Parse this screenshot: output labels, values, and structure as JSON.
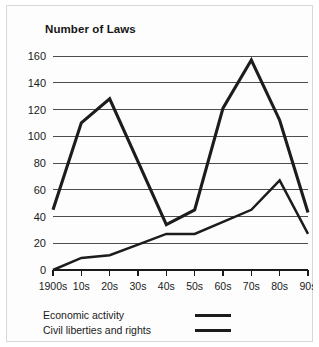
{
  "chart_data": {
    "type": "line",
    "title": "Number of Laws",
    "xlabel": "",
    "ylabel": "",
    "categories": [
      "1900s",
      "10s",
      "20s",
      "30s",
      "40s",
      "50s",
      "60s",
      "70s",
      "80s",
      "90s"
    ],
    "series": [
      {
        "name": "Economic activity",
        "values": [
          45,
          110,
          128,
          81,
          34,
          45,
          121,
          157,
          112,
          43
        ]
      },
      {
        "name": "Civil liberties and rights",
        "values": [
          0,
          9,
          11,
          19,
          27,
          27,
          36,
          45,
          67,
          27
        ]
      }
    ],
    "ylim": [
      0,
      160
    ],
    "yticks": [
      0,
      20,
      40,
      60,
      80,
      100,
      120,
      140,
      160
    ],
    "ytick_labels": [
      "0",
      "20",
      "40",
      "60",
      "80",
      "100",
      "120",
      "140",
      "160"
    ],
    "grid": true,
    "legend_position": "below-left",
    "line_color": "#1c1c1c"
  },
  "legend": {
    "items": [
      {
        "label": "Economic activity",
        "style": "thick"
      },
      {
        "label": "Civil liberties and rights",
        "style": "thin"
      }
    ]
  }
}
